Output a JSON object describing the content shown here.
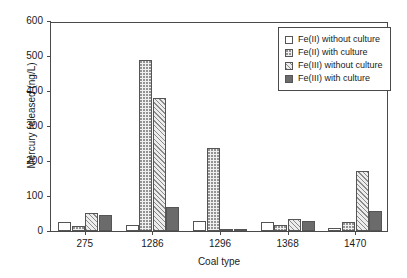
{
  "chart_data": {
    "type": "bar",
    "title": "",
    "xlabel": "Coal type",
    "ylabel": "Mercury released (ng/L)",
    "categories": [
      "275",
      "1286",
      "1296",
      "1368",
      "1470"
    ],
    "ylim": [
      0,
      600
    ],
    "yticks": [
      0,
      100,
      200,
      300,
      400,
      500,
      600
    ],
    "grid": false,
    "legend_position": "upper-right",
    "series": [
      {
        "name": "Fe(II) without culture",
        "pattern": "empty",
        "values": [
          25,
          18,
          30,
          25,
          8
        ]
      },
      {
        "name": "Fe(II) with culture",
        "pattern": "dotted",
        "values": [
          15,
          490,
          237,
          18,
          25
        ]
      },
      {
        "name": "Fe(III) without culture",
        "pattern": "hatched",
        "values": [
          52,
          380,
          4,
          35,
          172
        ]
      },
      {
        "name": "Fe(III) with culture",
        "pattern": "solid",
        "values": [
          45,
          70,
          4,
          30,
          57
        ]
      }
    ]
  },
  "colors": {
    "axis": "#4a4a4a",
    "bar_outline": "#555555",
    "solid_fill": "#6b6b6b",
    "background": "#ffffff"
  }
}
